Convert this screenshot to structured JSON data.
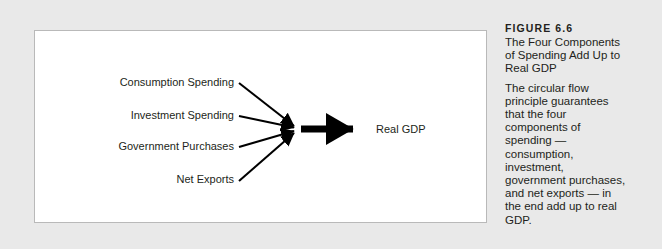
{
  "figure": {
    "number_label": "FIGURE 6.6",
    "title_lines": [
      "The Four Components",
      "of Spending Add Up to",
      "Real GDP"
    ],
    "body_lines": [
      "The circular flow",
      "principle guarantees",
      "that the four",
      "components of",
      "spending —",
      "consumption,",
      "investment,",
      "government purchases,",
      "and net exports — in",
      "the end add up to real",
      "GDP."
    ]
  },
  "diagram": {
    "inputs": [
      {
        "label": "Consumption Spending"
      },
      {
        "label": "Investment Spending"
      },
      {
        "label": "Government Purchases"
      },
      {
        "label": "Net Exports"
      }
    ],
    "output": {
      "label": "Real GDP"
    }
  },
  "colors": {
    "page_background": "#e9e9e9",
    "plate_background": "#ffffff",
    "plate_border": "#b9b9b9",
    "ink": "#231f20",
    "arrow": "#000000"
  }
}
